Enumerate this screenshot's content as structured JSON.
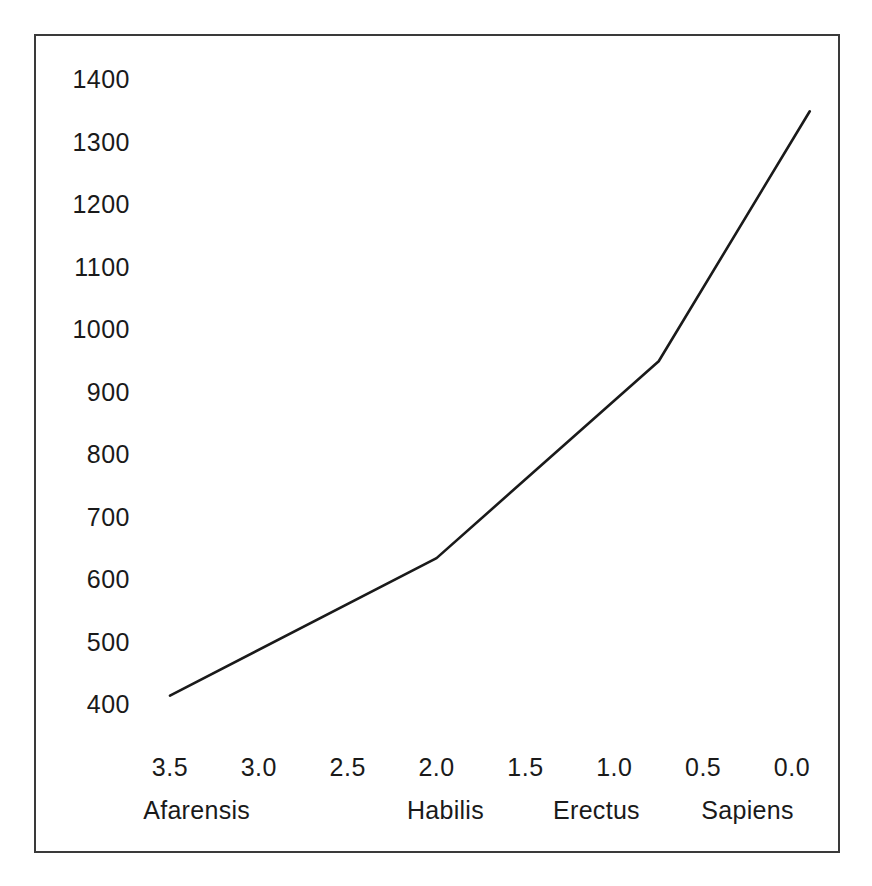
{
  "chart_data": {
    "type": "line",
    "title": "",
    "subtitle": "",
    "xlabel": "",
    "ylabel": "",
    "xlim": [
      3.7,
      -0.2
    ],
    "ylim": [
      370,
      1430
    ],
    "x_axis_inverted": true,
    "grid": false,
    "legend": null,
    "x_tick_labels": [
      "3.5",
      "3.0",
      "2.5",
      "2.0",
      "1.5",
      "1.0",
      "0.5",
      "0.0"
    ],
    "x_tick_values": [
      3.5,
      3.0,
      2.5,
      2.0,
      1.5,
      1.0,
      0.5,
      0.0
    ],
    "y_tick_labels": [
      "1400",
      "1300",
      "1200",
      "1100",
      "1000",
      "900",
      "800",
      "700",
      "600",
      "500",
      "400"
    ],
    "y_tick_values": [
      1400,
      1300,
      1200,
      1100,
      1000,
      900,
      800,
      700,
      600,
      500,
      400
    ],
    "group_labels": [
      {
        "label": "Afarensis",
        "x": 3.35
      },
      {
        "label": "Habilis",
        "x": 1.95
      },
      {
        "label": "Erectus",
        "x": 1.1
      },
      {
        "label": "Sapiens",
        "x": 0.25
      }
    ],
    "series": [
      {
        "name": "Cranial capacity",
        "color": "#1a1a1a",
        "x": [
          3.5,
          2.0,
          0.75,
          -0.1
        ],
        "values": [
          415,
          635,
          950,
          1350
        ],
        "points": [
          {
            "x": 3.5,
            "y": 415,
            "species": "Afarensis"
          },
          {
            "x": 2.0,
            "y": 635,
            "species": "Habilis"
          },
          {
            "x": 0.75,
            "y": 950,
            "species": "Erectus"
          },
          {
            "x": -0.1,
            "y": 1350,
            "species": "Sapiens"
          }
        ]
      }
    ]
  },
  "style": {
    "frame_color": "#3a3a3a",
    "line_color": "#1a1a1a",
    "text_color": "#1a1a1a",
    "background": "#ffffff"
  }
}
